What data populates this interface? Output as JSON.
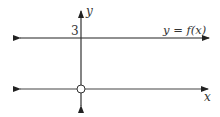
{
  "diagram": {
    "type": "function-graph",
    "axes": {
      "x_label": "x",
      "y_label": "y"
    },
    "curve_label": "y = f(x)",
    "y_tick_label": "3",
    "elements": [
      {
        "kind": "horizontal-line",
        "name": "graph-of-f",
        "y_value": 3,
        "arrows": "both"
      },
      {
        "kind": "horizontal-line",
        "name": "x-axis",
        "y_value": 0,
        "arrows": "both"
      },
      {
        "kind": "vertical-line",
        "name": "y-axis",
        "x_value": 0,
        "arrows": "both"
      },
      {
        "kind": "open-circle",
        "name": "origin-hole",
        "x": 0,
        "y": 0
      }
    ],
    "colors": {
      "line": "#222222",
      "text": "#333333",
      "background": "#ffffff"
    }
  }
}
